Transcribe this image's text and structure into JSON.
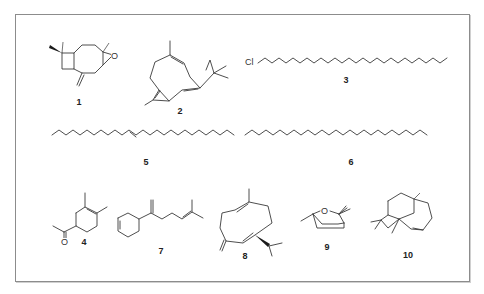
{
  "figure": {
    "compounds": [
      {
        "id": "1",
        "label": "1",
        "description": "caryophyllene oxide (bicyclic epoxide with exocyclic methylene)"
      },
      {
        "id": "2",
        "label": "2",
        "description": "humulene-type 11-membered ring triene"
      },
      {
        "id": "3",
        "label": "3",
        "description": "1-chloroalkane long chain",
        "heteroatom": "Cl"
      },
      {
        "id": "4",
        "label": "4",
        "description": "acetyl dimethylcyclohexene",
        "heteroatom": "O"
      },
      {
        "id": "5",
        "label": "5",
        "description": "long-chain alkene (E)"
      },
      {
        "id": "6",
        "label": "6",
        "description": "long-chain alkane"
      },
      {
        "id": "7",
        "label": "7",
        "description": "cyclohexenyl diene side chain"
      },
      {
        "id": "8",
        "label": "8",
        "description": "germacrene-type 10-membered ring with isopropyl"
      },
      {
        "id": "9",
        "label": "9",
        "description": "bicyclic ether (cineole-type)",
        "heteroatom": "O"
      },
      {
        "id": "10",
        "label": "10",
        "description": "tricyclic sesquiterpene (cyclobutane fused)"
      }
    ],
    "atoms": {
      "epoxide_O": "O",
      "chlorine": "Cl",
      "ketone_O": "O",
      "ether_O": "O"
    },
    "colors": {
      "bond": "#3a3a3a",
      "frame": "#8c8c8c",
      "background": "#ffffff"
    }
  }
}
